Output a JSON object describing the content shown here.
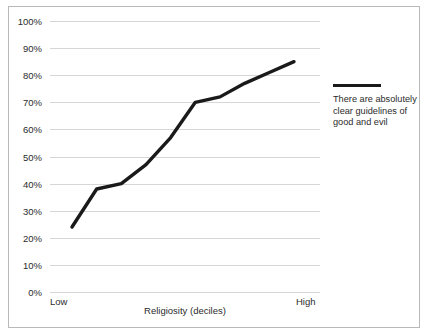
{
  "chart_data": {
    "type": "line",
    "title": "",
    "xlabel": "Religiosity (deciles)",
    "ylabel": "",
    "categories": [
      "1",
      "2",
      "3",
      "4",
      "5",
      "6",
      "7",
      "8",
      "9",
      "10"
    ],
    "x_tick_labels": [
      "Low",
      "High"
    ],
    "values": [
      24,
      38,
      40,
      47,
      57,
      70,
      72,
      77,
      81,
      85
    ],
    "series": [
      {
        "name": "There are absolutely clear guidelines of good and evil",
        "values": [
          24,
          38,
          40,
          47,
          57,
          70,
          72,
          77,
          81,
          85
        ]
      }
    ],
    "ylim": [
      0,
      100
    ],
    "y_tick_labels": [
      "0%",
      "10%",
      "20%",
      "30%",
      "40%",
      "50%",
      "60%",
      "70%",
      "80%",
      "90%",
      "100%"
    ],
    "y_tick_values": [
      0,
      10,
      20,
      30,
      40,
      50,
      60,
      70,
      80,
      90,
      100
    ],
    "grid": true,
    "legend_position": "right",
    "line_color": "#1a1a1a",
    "gridline_color": "#d6d6d6",
    "background_color": "#ffffff",
    "border_color": "#b9b9b9"
  },
  "legend": {
    "label": "There are absolutely clear guidelines of good and evil"
  },
  "axis": {
    "x_low": "Low",
    "x_high": "High",
    "x_title": "Religiosity (deciles)"
  }
}
